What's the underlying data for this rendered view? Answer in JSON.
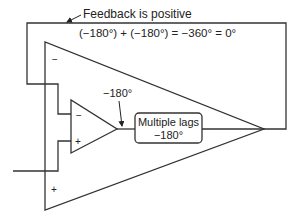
{
  "diagram": {
    "title": "Feedback is positive",
    "equation": "(−180°) + (−180°) = −360° = 0°",
    "amp_output_phase": "−180°",
    "lag_block": {
      "line1": "Multiple lags",
      "line2": "−180°"
    },
    "large_amp": {
      "inverting_sign": "−",
      "noninverting_sign": "+"
    },
    "small_amp": {
      "inverting_sign": "−",
      "noninverting_sign": "+"
    },
    "colors": {
      "line": "#333333",
      "text": "#222222",
      "background": "#ffffff"
    }
  }
}
